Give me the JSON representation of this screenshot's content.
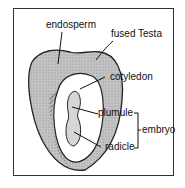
{
  "diagram": {
    "labels": {
      "endosperm": "endosperm",
      "testa": "fused Testa",
      "cotyledon": "cotyledon",
      "plumule": "plumule",
      "radicle": "radicle",
      "embryo": "embryo"
    },
    "colors": {
      "outline": "#222222",
      "endosperm_fill": "#b5b5b5",
      "inner_fill": "#ffffff"
    }
  }
}
